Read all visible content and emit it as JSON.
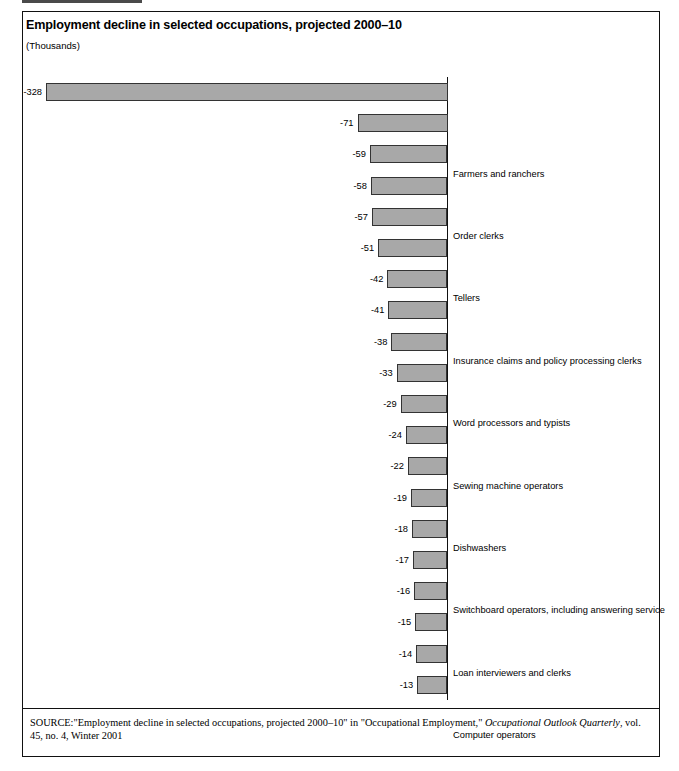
{
  "figure": {
    "title": "Employment decline in selected occupations, projected 2000–10",
    "units": "(Thousands)",
    "source_prefix": "SOURCE:",
    "source_quote_1": "\"Employment decline in selected occupations, projected 2000–10\" in \"Occupational Employment,\" ",
    "source_italic": "Occupational Outlook Quarterly",
    "source_tail": ", vol. 45, no. 4, Winter 2001"
  },
  "colors": {
    "bar_fill": "#a8a8a8",
    "bar_stroke": "#333333",
    "frame": "#111111",
    "text": "#000000",
    "page_background": "#ffffff"
  },
  "chart_data": {
    "type": "bar",
    "orientation": "horizontal-negative",
    "title": "Employment decline in selected occupations, projected 2000–10",
    "subtitle": "(Thousands)",
    "xlabel": "",
    "ylabel": "",
    "units": "Thousands",
    "grid": false,
    "legend": false,
    "xlim": [
      -328,
      0
    ],
    "categories": [
      "Farmers and ranchers",
      "Order clerks",
      "Tellers",
      "Insurance claims and policy processing clerks",
      "Word processors and typists",
      "Sewing machine operators",
      "Dishwashers",
      "Switchboard operators, including answering service",
      "Loan interviewers and clerks",
      "Computer operators",
      "Dining room and cafeteria attendants and bartender helpers",
      "Electrical and electronic equipment assemblers",
      "Machine feeders and offbearers",
      "Telephone operators",
      "Secretaries, except legal, medical, and executive",
      "Prepress technicians and workers",
      "Office machine operators, except computer",
      "Cutting, punching, and press machine setters, operators,\nand tenders, metal and plastic",
      "Postal Service mail sorters, processors, and processing\nmachine operators",
      "Railroad brake, signal, and switch operators"
    ],
    "values": [
      -328,
      -71,
      -59,
      -58,
      -57,
      -51,
      -42,
      -41,
      -38,
      -33,
      -29,
      -24,
      -22,
      -19,
      -18,
      -17,
      -16,
      -15,
      -14,
      -13
    ],
    "value_labels": [
      "-328",
      "-71",
      "-59",
      "-58",
      "-57",
      "-51",
      "-42",
      "-41",
      "-38",
      "-33",
      "-29",
      "-24",
      "-22",
      "-19",
      "-18",
      "-17",
      "-16",
      "-15",
      "-14",
      "-13"
    ]
  }
}
